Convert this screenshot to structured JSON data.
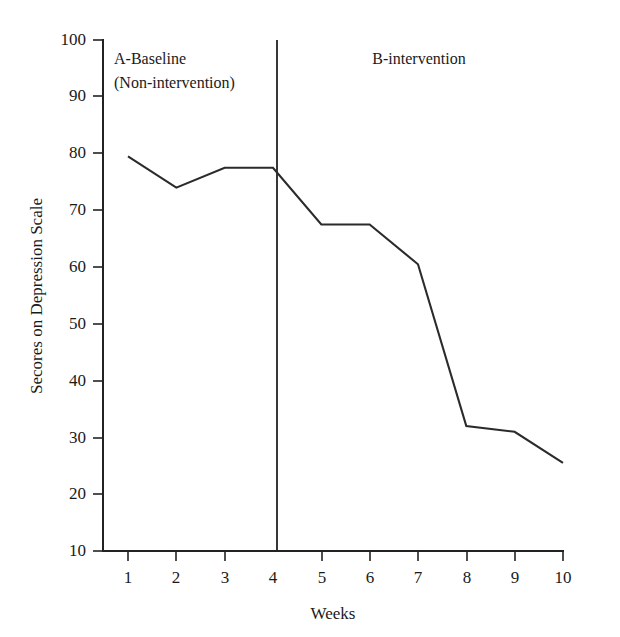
{
  "chart_data": {
    "type": "line",
    "title": "",
    "xlabel": "Weeks",
    "ylabel": "Secores on Depression Scale",
    "x": [
      1,
      2,
      3,
      4,
      5,
      6,
      7,
      8,
      9,
      10
    ],
    "categories": [
      "1",
      "2",
      "3",
      "4",
      "5",
      "6",
      "7",
      "8",
      "9",
      "10"
    ],
    "series": [
      {
        "name": "Depression score",
        "values": [
          79.5,
          74.0,
          77.5,
          77.5,
          67.5,
          67.5,
          60.5,
          32.0,
          31.0,
          25.5
        ]
      }
    ],
    "xlim": [
      0.4,
      10.4
    ],
    "ylim": [
      0,
      100
    ],
    "ytick_values": [
      10,
      20,
      30,
      40,
      50,
      60,
      70,
      80,
      90,
      100
    ],
    "ytick_labels": [
      "10",
      "20",
      "30",
      "40",
      "50",
      "60",
      "70",
      "80",
      "90",
      "100"
    ],
    "xtick_labels": [
      "1",
      "2",
      "3",
      "4",
      "5",
      "6",
      "7",
      "8",
      "9",
      "10"
    ],
    "grid": false,
    "legend": false,
    "legend_position": "none",
    "line_color": "#2b2b2b",
    "axis_color": "#222222",
    "background_color": "#ffffff",
    "annotations": [
      {
        "name": "phase-a",
        "line1": "A-Baseline",
        "line2": "(Non-intervention)",
        "x_range": [
          0.4,
          3.5
        ]
      },
      {
        "name": "phase-b",
        "line1": "B-intervention",
        "line2": "",
        "x_range": [
          3.5,
          10.4
        ]
      }
    ],
    "phase_divider": {
      "x": 3.5,
      "label": "phase change line"
    }
  },
  "axes": {
    "y_title": "Secores on Depression Scale",
    "x_title": "Weeks"
  },
  "labels": {
    "y": [
      "100",
      "90",
      "80",
      "70",
      "60",
      "50",
      "40",
      "30",
      "20",
      "10"
    ],
    "x": [
      "1",
      "2",
      "3",
      "4",
      "5",
      "6",
      "7",
      "8",
      "9",
      "10"
    ],
    "phase_a_line1": "A-Baseline",
    "phase_a_line2": "(Non-intervention)",
    "phase_b_line1": "B-intervention"
  }
}
